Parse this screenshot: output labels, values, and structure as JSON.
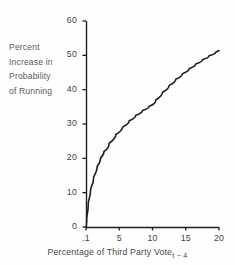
{
  "chart_data": {
    "type": "line",
    "title": "",
    "xlabel": "Percentage of Third Party Vote",
    "xlabel_subscript": "t − 4",
    "ylabel_lines": [
      "Percent",
      "Increase in",
      "Probability",
      "of Running"
    ],
    "ylabel": "Percent Increase in Probability of Running",
    "x_ticks": [
      ".1",
      "5",
      "10",
      "15",
      "20"
    ],
    "x_tick_values": [
      0.1,
      5,
      10,
      15,
      20
    ],
    "y_ticks": [
      "0",
      "10",
      "20",
      "30",
      "40",
      "50",
      "60"
    ],
    "y_tick_values": [
      0,
      10,
      20,
      30,
      40,
      50,
      60
    ],
    "xlim": [
      0.1,
      20
    ],
    "ylim": [
      0,
      60
    ],
    "grid": false,
    "legend": null,
    "series": [
      {
        "name": "Percent increase in probability of running",
        "x": [
          0.1,
          0.3,
          0.6,
          1.0,
          1.5,
          2.0,
          2.5,
          3.0,
          4.0,
          5.0,
          6.0,
          7.0,
          8.0,
          9.0,
          10.0,
          11.0,
          12.0,
          13.0,
          14.0,
          15.0,
          16.0,
          17.0,
          18.0,
          19.0,
          20.0
        ],
        "y": [
          0.0,
          5.2,
          9.4,
          13.0,
          16.4,
          19.0,
          21.1,
          22.9,
          25.8,
          28.1,
          30.1,
          31.8,
          33.3,
          34.6,
          35.8,
          38.2,
          40.3,
          42.2,
          43.9,
          45.4,
          46.8,
          48.1,
          49.3,
          50.4,
          51.4
        ],
        "color": "#201d1d",
        "line_width": 1.6,
        "markers": false
      }
    ],
    "axis_color": "#201d1d",
    "background": "#fefefe",
    "curve_endpoint_label": "56"
  },
  "geometry": {
    "plot_left": 86,
    "plot_right": 219,
    "plot_top": 21,
    "plot_bottom": 227
  }
}
